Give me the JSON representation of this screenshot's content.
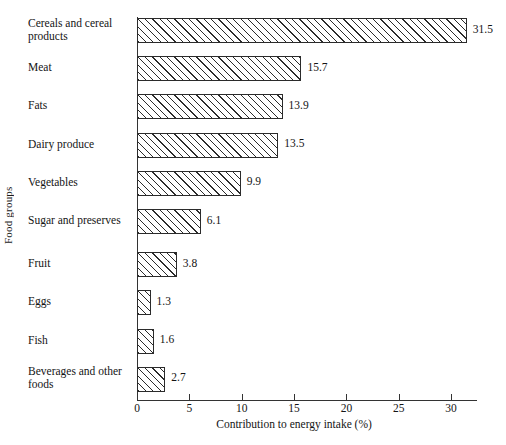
{
  "chart_data": {
    "type": "bar",
    "orientation": "horizontal",
    "title": "",
    "xlabel": "Contribution to energy intake (%)",
    "ylabel": "Food groups",
    "xlim": [
      0,
      32.5
    ],
    "xticks": [
      0,
      5,
      10,
      15,
      20,
      25,
      30
    ],
    "xtick_labels": [
      "0",
      "5",
      "10",
      "15",
      "20",
      "25",
      "30"
    ],
    "grid": false,
    "legend": null,
    "categories": [
      "Cereals and cereal products",
      "Meat",
      "Fats",
      "Dairy produce",
      "Vegetables",
      "Sugar and preserves",
      "Fruit",
      "Eggs",
      "Fish",
      "Beverages and other foods"
    ],
    "values": [
      31.5,
      15.7,
      13.9,
      13.5,
      9.9,
      6.1,
      3.8,
      1.3,
      1.6,
      2.7
    ],
    "value_labels": [
      "31.5",
      "15.7",
      "13.9",
      "13.5",
      "9.9",
      "6.1",
      "3.8",
      "1.3",
      "1.6",
      "2.7"
    ],
    "bars": [
      {
        "label": "Cereals and cereal products",
        "label_lines": [
          "Cereals and cereal",
          "products"
        ],
        "value": 31.5,
        "value_label": "31.5"
      },
      {
        "label": "Meat",
        "label_lines": [
          "Meat"
        ],
        "value": 15.7,
        "value_label": "15.7"
      },
      {
        "label": "Fats",
        "label_lines": [
          "Fats"
        ],
        "value": 13.9,
        "value_label": "13.9"
      },
      {
        "label": "Dairy produce",
        "label_lines": [
          "Dairy produce"
        ],
        "value": 13.5,
        "value_label": "13.5"
      },
      {
        "label": "Vegetables",
        "label_lines": [
          "Vegetables"
        ],
        "value": 9.9,
        "value_label": "9.9"
      },
      {
        "label": "Sugar and preserves",
        "label_lines": [
          "Sugar and preserves"
        ],
        "value": 6.1,
        "value_label": "6.1"
      },
      {
        "label": "Fruit",
        "label_lines": [
          "Fruit"
        ],
        "value": 3.8,
        "value_label": "3.8"
      },
      {
        "label": "Eggs",
        "label_lines": [
          "Eggs"
        ],
        "value": 1.3,
        "value_label": "1.3"
      },
      {
        "label": "Fish",
        "label_lines": [
          "Fish"
        ],
        "value": 1.6,
        "value_label": "1.6"
      },
      {
        "label": "Beverages and other foods",
        "label_lines": [
          "Beverages and other",
          "foods"
        ],
        "value": 2.7,
        "value_label": "2.7"
      }
    ],
    "style": {
      "bar_fill": "#ffffff",
      "bar_edge": "#2b2b2b",
      "bar_pattern": "diagonal-hatch",
      "axis_color": "#333333",
      "text_color": "#141414",
      "background": "#ffffff"
    }
  }
}
